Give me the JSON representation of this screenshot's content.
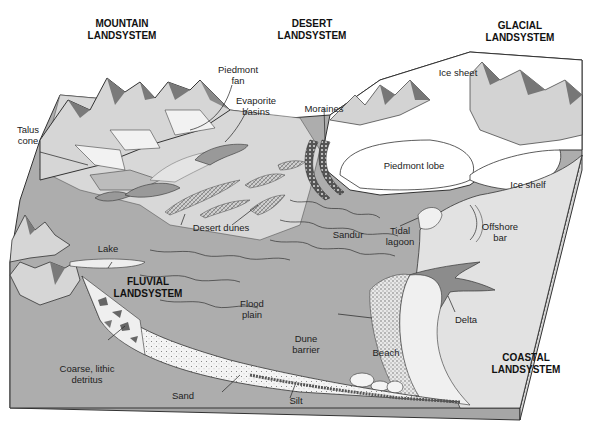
{
  "diagram": {
    "type": "block-diagram",
    "colors": {
      "background": "#ffffff",
      "land_dark": "#a9a9a9",
      "land_mid": "#bdbdbd",
      "land_light": "#d9d9d9",
      "ice": "#ffffff",
      "sea": "#e3e3e3",
      "outline": "#333333",
      "mountain_shadow": "#7a7a7a",
      "mountain_light": "#e6e6e6"
    },
    "landsystems": [
      {
        "id": "mountain",
        "line1": "MOUNTAIN",
        "line2": "LANDSYSTEM"
      },
      {
        "id": "desert",
        "line1": "DESERT",
        "line2": "LANDSYSTEM"
      },
      {
        "id": "glacial",
        "line1": "GLACIAL",
        "line2": "LANDSYSTEM"
      },
      {
        "id": "fluvial",
        "line1": "FLUVIAL",
        "line2": "LANDSYSTEM"
      },
      {
        "id": "coastal",
        "line1": "COASTAL",
        "line2": "LANDSYSTEM"
      }
    ],
    "labels": {
      "piedmont_fan": {
        "line1": "Piedmont",
        "line2": "fan"
      },
      "evaporite_basins": {
        "line1": "Evaporite",
        "line2": "basins"
      },
      "talus_cone": {
        "line1": "Talus",
        "line2": "cone"
      },
      "moraines": {
        "line1": "Moraines"
      },
      "ice_sheet": {
        "line1": "Ice sheet"
      },
      "piedmont_lobe": {
        "line1": "Piedmont lobe"
      },
      "ice_shelf": {
        "line1": "Ice shelf"
      },
      "desert_dunes": {
        "line1": "Desert dunes"
      },
      "sandur": {
        "line1": "Sandur"
      },
      "tidal_lagoon": {
        "line1": "Tidal",
        "line2": "lagoon"
      },
      "offshore_bar": {
        "line1": "Offshore",
        "line2": "bar"
      },
      "lake": {
        "line1": "Lake"
      },
      "flood_plain": {
        "line1": "Flood",
        "line2": "plain"
      },
      "dune_barrier": {
        "line1": "Dune",
        "line2": "barrier"
      },
      "delta": {
        "line1": "Delta"
      },
      "beach": {
        "line1": "Beach"
      },
      "coarse_detritus": {
        "line1": "Coarse, lithic",
        "line2": "detritus"
      },
      "sand": {
        "line1": "Sand"
      },
      "silt": {
        "line1": "Silt"
      }
    }
  }
}
